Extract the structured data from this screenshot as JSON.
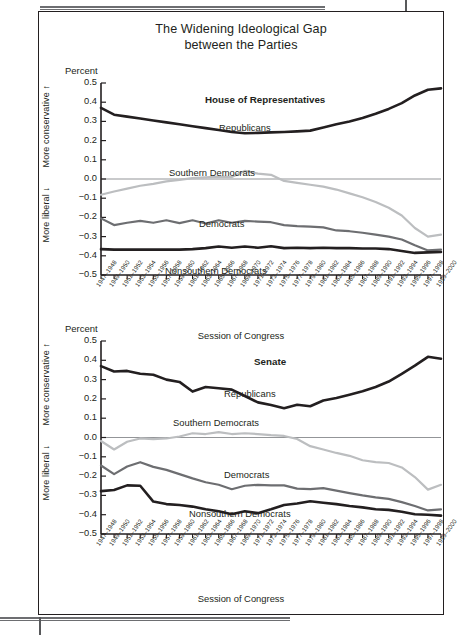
{
  "figure": {
    "title_line1": "The Widening Ideological Gap",
    "title_line2": "between the Parties"
  },
  "axis": {
    "percent_label": "Percent",
    "more_conservative": "More conservative",
    "more_liberal": "More liberal",
    "up_arrow": "↑",
    "down_arrow": "↓",
    "x_title": "Session of Congress",
    "y_ticks": [
      "0.5",
      "0.4",
      "0.3",
      "0.2",
      "0.1",
      "0.0",
      "−0.1",
      "−0.2",
      "−0.3",
      "−0.4",
      "−0.5"
    ]
  },
  "colors": {
    "republicans": "#231f20",
    "democrats": "#6d6e71",
    "southern_democrats": "#bcbec0",
    "nonsouthern_democrats": "#231f20",
    "axis": "#231f20",
    "zero_line": "#939598",
    "background": "#ffffff"
  },
  "series_labels": {
    "republicans": "Republicans",
    "southern_democrats": "Southern Democrats",
    "democrats": "Democrats",
    "nonsouthern_democrats": "Nonsouthern Democrats"
  },
  "panels": {
    "house": {
      "title": "House of Representatives"
    },
    "senate": {
      "title": "Senate"
    }
  },
  "chart_data": [
    {
      "type": "line",
      "title": "House of Representatives",
      "xlabel": "Session of Congress",
      "ylabel": "Percent",
      "ylim": [
        -0.5,
        0.5
      ],
      "grid": false,
      "legend": "inline-labels",
      "categories": [
        "1947–1948",
        "1949–1950",
        "1951–1952",
        "1953–1954",
        "1955–1956",
        "1957–1958",
        "1959–1960",
        "1961–1962",
        "1963–1964",
        "1965–1966",
        "1967–1968",
        "1969–1970",
        "1971–1972",
        "1973–1974",
        "1975–1976",
        "1977–1978",
        "1979–1980",
        "1981–1982",
        "1983–1984",
        "1985–1986",
        "1987–1988",
        "1989–1990",
        "1991–1992",
        "1993–1994",
        "1995–1996",
        "1997–1998",
        "1999–2000"
      ],
      "series": [
        {
          "name": "Republicans",
          "values": [
            0.37,
            0.335,
            0.325,
            0.315,
            0.305,
            0.295,
            0.285,
            0.275,
            0.265,
            0.255,
            0.245,
            0.238,
            0.24,
            0.243,
            0.245,
            0.248,
            0.252,
            0.268,
            0.285,
            0.3,
            0.318,
            0.34,
            0.365,
            0.395,
            0.435,
            0.465,
            0.472
          ]
        },
        {
          "name": "Southern Democrats",
          "values": [
            -0.082,
            -0.065,
            -0.05,
            -0.035,
            -0.025,
            -0.012,
            -0.005,
            0.005,
            0.008,
            0.012,
            0.01,
            0.042,
            0.028,
            0.022,
            -0.01,
            -0.02,
            -0.03,
            -0.04,
            -0.055,
            -0.075,
            -0.095,
            -0.12,
            -0.15,
            -0.19,
            -0.255,
            -0.3,
            -0.29
          ]
        },
        {
          "name": "Democrats",
          "values": [
            -0.205,
            -0.24,
            -0.228,
            -0.218,
            -0.228,
            -0.215,
            -0.23,
            -0.215,
            -0.232,
            -0.215,
            -0.228,
            -0.218,
            -0.222,
            -0.225,
            -0.24,
            -0.245,
            -0.248,
            -0.252,
            -0.268,
            -0.272,
            -0.28,
            -0.29,
            -0.3,
            -0.315,
            -0.345,
            -0.372,
            -0.368
          ]
        },
        {
          "name": "Nonsouthern Democrats",
          "values": [
            -0.365,
            -0.368,
            -0.368,
            -0.368,
            -0.368,
            -0.368,
            -0.368,
            -0.365,
            -0.36,
            -0.352,
            -0.358,
            -0.352,
            -0.358,
            -0.35,
            -0.36,
            -0.358,
            -0.36,
            -0.358,
            -0.36,
            -0.36,
            -0.362,
            -0.362,
            -0.365,
            -0.375,
            -0.385,
            -0.382,
            -0.38
          ]
        }
      ]
    },
    {
      "type": "line",
      "title": "Senate",
      "xlabel": "Session of Congress",
      "ylabel": "Percent",
      "ylim": [
        -0.5,
        0.5
      ],
      "grid": false,
      "legend": "inline-labels",
      "categories": [
        "1947–1948",
        "1949–1950",
        "1951–1952",
        "1953–1954",
        "1955–1956",
        "1957–1958",
        "1959–1960",
        "1961–1962",
        "1963–1964",
        "1965–1966",
        "1967–1968",
        "1969–1970",
        "1971–1972",
        "1973–1974",
        "1975–1976",
        "1977–1978",
        "1979–1980",
        "1981–1982",
        "1983–1984",
        "1985–1986",
        "1987–1988",
        "1989–1990",
        "1991–1992",
        "1993–1994",
        "1995–1996",
        "1997–1998",
        "1999–2000"
      ],
      "series": [
        {
          "name": "Republicans",
          "values": [
            0.37,
            0.342,
            0.345,
            0.33,
            0.325,
            0.3,
            0.288,
            0.238,
            0.262,
            0.255,
            0.248,
            0.215,
            0.182,
            0.168,
            0.152,
            0.17,
            0.162,
            0.192,
            0.205,
            0.222,
            0.24,
            0.262,
            0.29,
            0.33,
            0.372,
            0.418,
            0.408
          ]
        },
        {
          "name": "Southern Democrats",
          "values": [
            -0.018,
            -0.062,
            -0.022,
            -0.005,
            -0.008,
            -0.005,
            0.005,
            0.022,
            0.018,
            0.028,
            0.018,
            0.022,
            0.018,
            0.012,
            0.008,
            -0.008,
            -0.045,
            -0.062,
            -0.08,
            -0.095,
            -0.118,
            -0.128,
            -0.132,
            -0.155,
            -0.205,
            -0.27,
            -0.245
          ]
        },
        {
          "name": "Democrats",
          "values": [
            -0.145,
            -0.19,
            -0.15,
            -0.128,
            -0.152,
            -0.168,
            -0.19,
            -0.212,
            -0.232,
            -0.245,
            -0.268,
            -0.25,
            -0.245,
            -0.248,
            -0.248,
            -0.265,
            -0.268,
            -0.262,
            -0.275,
            -0.288,
            -0.3,
            -0.31,
            -0.318,
            -0.335,
            -0.355,
            -0.378,
            -0.372
          ]
        },
        {
          "name": "Nonsouthern Democrats",
          "values": [
            -0.278,
            -0.272,
            -0.248,
            -0.25,
            -0.332,
            -0.345,
            -0.35,
            -0.358,
            -0.372,
            -0.382,
            -0.398,
            -0.382,
            -0.392,
            -0.372,
            -0.35,
            -0.342,
            -0.33,
            -0.338,
            -0.345,
            -0.355,
            -0.362,
            -0.372,
            -0.375,
            -0.385,
            -0.398,
            -0.4,
            -0.405
          ]
        }
      ]
    }
  ]
}
